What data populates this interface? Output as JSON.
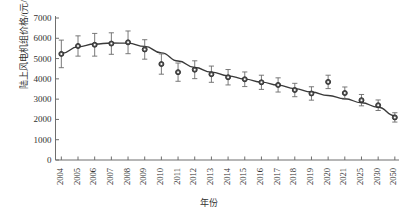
{
  "chart_data": {
    "type": "line",
    "title": "",
    "xlabel": "年份",
    "ylabel": "陆上风电机组价格/(元/kW)",
    "grid": false,
    "legend": "none",
    "marker": "circle",
    "line_color": "#3a3a3a",
    "marker_color": "#555555",
    "errorbar_color": "#6b6b6b",
    "ylim": [
      0,
      7000
    ],
    "yticks": [
      0,
      1000,
      2000,
      3000,
      4000,
      5000,
      6000,
      7000
    ],
    "ytick_labels": [
      "0",
      "1000",
      "2000",
      "3000",
      "4000",
      "5000",
      "6000",
      "7000"
    ],
    "categories": [
      "2004",
      "2005",
      "2006",
      "2007",
      "2008",
      "2009",
      "2010",
      "2011",
      "2012",
      "2013",
      "2014",
      "2015",
      "2016",
      "2017",
      "2018",
      "2019",
      "2020",
      "2021",
      "2025",
      "2030",
      "2050"
    ],
    "series": [
      {
        "name": "陆上风电机组价格",
        "values": [
          5230,
          5620,
          5680,
          5740,
          5800,
          5450,
          4730,
          4330,
          4450,
          4230,
          4080,
          3980,
          3830,
          3700,
          3450,
          3280,
          3850,
          3300,
          2950,
          2700,
          2100
        ],
        "err_upper": [
          680,
          500,
          560,
          530,
          560,
          480,
          500,
          450,
          440,
          400,
          380,
          360,
          350,
          350,
          330,
          330,
          330,
          300,
          280,
          260,
          230
        ],
        "err_lower": [
          680,
          500,
          560,
          530,
          560,
          480,
          500,
          450,
          440,
          400,
          380,
          360,
          350,
          350,
          330,
          330,
          330,
          300,
          280,
          260,
          230
        ]
      }
    ],
    "trend_line": {
      "name": "拟合曲线",
      "values": [
        5250,
        5580,
        5720,
        5770,
        5760,
        5600,
        5280,
        4880,
        4560,
        4330,
        4150,
        3990,
        3840,
        3690,
        3520,
        3350,
        3180,
        3020,
        2820,
        2600,
        2180
      ]
    }
  }
}
